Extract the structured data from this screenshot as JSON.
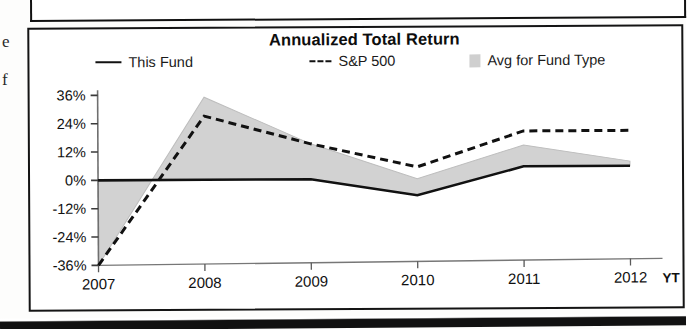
{
  "page": {
    "margin_fragments": [
      "e",
      "f"
    ]
  },
  "chart": {
    "title": "Annualized Total Return",
    "legend": [
      {
        "label": "This Fund",
        "marker": "solid-line-swatch",
        "color": "#111111"
      },
      {
        "label": "S&P 500",
        "marker": "dashed-line-swatch",
        "color": "#111111",
        "prefix": "---"
      },
      {
        "label": "Avg for Fund Type",
        "marker": "filled-square-swatch",
        "color": "#cfcfcf"
      }
    ],
    "x_axis_unit_label": "YT"
  },
  "chart_data": {
    "type": "line",
    "title": "Annualized Total Return",
    "xlabel": "",
    "ylabel": "",
    "categories": [
      "2007",
      "2008",
      "2009",
      "2010",
      "2011",
      "2012"
    ],
    "x_tick_labels": [
      "2007",
      "2008",
      "2009",
      "2010",
      "2011",
      "2012"
    ],
    "y_tick_labels": [
      "36%",
      "24%",
      "12%",
      "0%",
      "-12%",
      "-24%",
      "-36%"
    ],
    "y_ticks": [
      36,
      24,
      12,
      0,
      -12,
      -24,
      -36
    ],
    "ylim": [
      -36,
      36
    ],
    "grid": false,
    "legend_position": "top",
    "value_suffix": "%",
    "series": [
      {
        "name": "This Fund",
        "style": "solid",
        "color": "#111111",
        "values": [
          0,
          0,
          0,
          -7,
          5,
          5
        ]
      },
      {
        "name": "S&P 500",
        "style": "dashed",
        "color": "#111111",
        "values": [
          -36,
          27,
          15,
          5,
          20,
          20
        ]
      },
      {
        "name": "Avg for Fund Type",
        "style": "filled-band",
        "color": "#d2d2d2",
        "values": [
          -36,
          35,
          15,
          0,
          14,
          7
        ]
      }
    ]
  }
}
